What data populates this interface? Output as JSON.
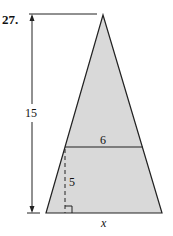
{
  "problem": {
    "number_label": "27."
  },
  "figure": {
    "type": "isosceles triangle with inscribed horizontal segment",
    "fill_color": "#d9d9d9",
    "stroke_color": "#222222",
    "labels": {
      "total_height": "15",
      "segment_width": "6",
      "lower_height": "5",
      "base": "x"
    }
  }
}
